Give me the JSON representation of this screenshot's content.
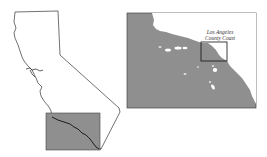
{
  "map": {
    "title": "California coastline location map",
    "colors": {
      "ocean_fill": "#8f8f8f",
      "land_fill": "#ffffff",
      "outline": "#333333",
      "background": "#ffffff"
    },
    "state_outline": {
      "name": "California",
      "highlight_box": {
        "x": 46,
        "y": 113,
        "width": 54,
        "height": 37
      }
    },
    "inset": {
      "frame": {
        "x": 127,
        "y": 13,
        "width": 129,
        "height": 95
      },
      "study_area_box": {
        "x": 201,
        "y": 42,
        "width": 26,
        "height": 19
      },
      "study_area_label_line1": "Los Angeles",
      "study_area_label_line2": "County Coast"
    }
  }
}
